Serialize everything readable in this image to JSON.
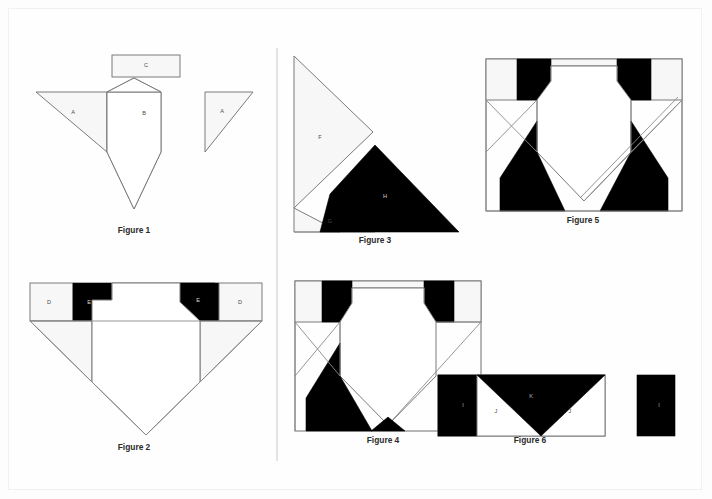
{
  "document": {
    "kind": "geometric-piecing-diagram",
    "background_color": "#fdfdfd",
    "sheet_color": "#fefefe",
    "outline_fill": "#f7f7f7",
    "outline_stroke": "#7b7b7b",
    "black_fill": "#000000",
    "white_fill": "#ffffff"
  },
  "divider": {
    "orientation": "vertical",
    "color": "#d8d8d8"
  },
  "figures": [
    {
      "id": "figure-1",
      "caption": "Figure 1",
      "caption_x": 134,
      "caption_y": 233,
      "pieces": [
        {
          "label": "A",
          "label_x": 73,
          "label_y": 113,
          "on_dark": false
        },
        {
          "label": "B",
          "label_x": 144,
          "label_y": 114,
          "on_dark": false
        },
        {
          "label": "C",
          "label_x": 146,
          "label_y": 66,
          "on_dark": false
        },
        {
          "label": "A",
          "label_x": 222,
          "label_y": 112,
          "on_dark": false
        }
      ]
    },
    {
      "id": "figure-2",
      "caption": "Figure 2",
      "caption_x": 134,
      "caption_y": 450,
      "pieces": [
        {
          "label": "D",
          "label_x": 49,
          "label_y": 303,
          "on_dark": false
        },
        {
          "label": "E",
          "label_x": 89,
          "label_y": 303,
          "on_dark": true
        },
        {
          "label": "E",
          "label_x": 198,
          "label_y": 301,
          "on_dark": true
        },
        {
          "label": "D",
          "label_x": 240,
          "label_y": 303,
          "on_dark": false
        }
      ]
    },
    {
      "id": "figure-3",
      "caption": "Figure 3",
      "caption_x": 375,
      "caption_y": 243,
      "pieces": [
        {
          "label": "F",
          "label_x": 320,
          "label_y": 138,
          "on_dark": false
        },
        {
          "label": "G",
          "label_x": 330,
          "label_y": 222,
          "on_dark": false
        },
        {
          "label": "H",
          "label_x": 385,
          "label_y": 197,
          "on_dark": true
        }
      ]
    },
    {
      "id": "figure-4",
      "caption": "Figure 4",
      "caption_x": 383,
      "caption_y": 443,
      "pieces": []
    },
    {
      "id": "figure-5",
      "caption": "Figure 5",
      "caption_x": 583,
      "caption_y": 223,
      "pieces": []
    },
    {
      "id": "figure-6",
      "caption": "Figure 6",
      "caption_x": 530,
      "caption_y": 443,
      "pieces": [
        {
          "label": "I",
          "label_x": 463,
          "label_y": 406,
          "on_dark": true
        },
        {
          "label": "J",
          "label_x": 496,
          "label_y": 412,
          "on_dark": false
        },
        {
          "label": "K",
          "label_x": 531,
          "label_y": 397,
          "on_dark": true
        },
        {
          "label": "J",
          "label_x": 570,
          "label_y": 412,
          "on_dark": false
        },
        {
          "label": "I",
          "label_x": 659,
          "label_y": 406,
          "on_dark": true
        }
      ]
    }
  ]
}
